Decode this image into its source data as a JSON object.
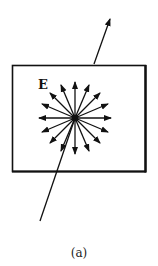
{
  "figure": {
    "field_label": "E",
    "caption": "(a)",
    "colors": {
      "ink": "#111111",
      "background": "#ffffff"
    },
    "box": {
      "x": 12,
      "y": 65,
      "width": 134,
      "height": 107
    },
    "center": {
      "x": 75,
      "y": 118
    },
    "radial_arrow_count": 16,
    "radial_arrow_length": 36
  }
}
